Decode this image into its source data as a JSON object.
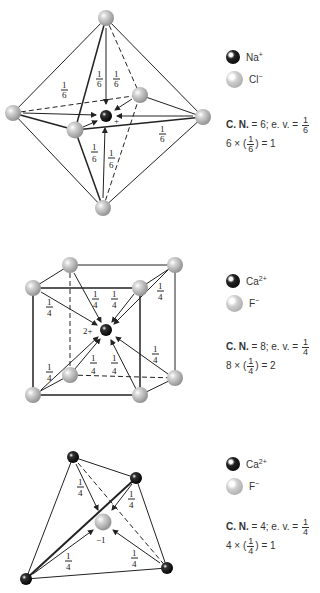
{
  "panels": [
    {
      "id": "nacl-octahedron",
      "structure": "octahedral",
      "center_ion": {
        "symbol": "Na",
        "charge": "+"
      },
      "center_label": "+",
      "legend": [
        {
          "name": "Na",
          "charge": "+",
          "style": "dark"
        },
        {
          "name": "Cl",
          "charge": "−",
          "style": "light"
        }
      ],
      "coordination_number_label": "C. N.",
      "coordination_number": "6",
      "ev_label": "e. v.",
      "ev_num": "1",
      "ev_den": "6",
      "sum_multiplier": "6",
      "sum_result": "1",
      "bond_fraction": {
        "num": "1",
        "den": "6"
      }
    },
    {
      "id": "caf2-cube",
      "structure": "cubic",
      "center_ion": {
        "symbol": "Ca",
        "charge": "2+"
      },
      "center_label": "2+",
      "legend": [
        {
          "name": "Ca",
          "charge": "2+",
          "style": "dark"
        },
        {
          "name": "F",
          "charge": "−",
          "style": "light"
        }
      ],
      "coordination_number_label": "C. N.",
      "coordination_number": "8",
      "ev_label": "e. v.",
      "ev_num": "1",
      "ev_den": "4",
      "sum_multiplier": "8",
      "sum_result": "2",
      "bond_fraction": {
        "num": "1",
        "den": "4"
      }
    },
    {
      "id": "caf2-tetrahedron",
      "structure": "tetrahedral",
      "center_ion": {
        "symbol": "F",
        "charge": "−1"
      },
      "center_label": "−1",
      "legend": [
        {
          "name": "Ca",
          "charge": "2+",
          "style": "dark"
        },
        {
          "name": "F",
          "charge": "−",
          "style": "light"
        }
      ],
      "coordination_number_label": "C. N.",
      "coordination_number": "4",
      "ev_label": "e. v.",
      "ev_num": "1",
      "ev_den": "4",
      "sum_multiplier": "4",
      "sum_result": "1",
      "bond_fraction": {
        "num": "1",
        "den": "4"
      }
    }
  ],
  "colors": {
    "line": "#222222",
    "light_ion": "#b0b0b0",
    "dark_ion": "#111111"
  }
}
